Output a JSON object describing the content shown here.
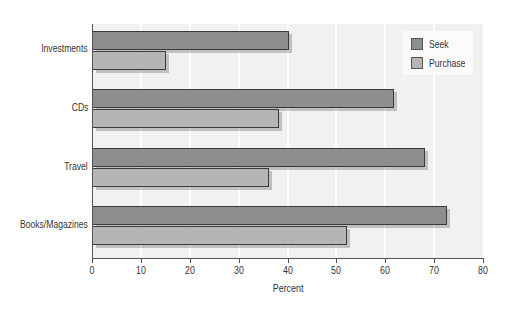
{
  "chart_data": {
    "type": "bar",
    "orientation": "horizontal",
    "title": "",
    "xlabel": "Percent",
    "ylabel": "",
    "xlim": [
      0,
      80
    ],
    "xticks": [
      0,
      10,
      20,
      30,
      40,
      50,
      60,
      70,
      80
    ],
    "grid": true,
    "legend_position": "top-right",
    "categories": [
      "Investments",
      "CDs",
      "Travel",
      "Books/Magazines"
    ],
    "series": [
      {
        "name": "Seek",
        "color": "#8e8e8e",
        "values": [
          40,
          61.5,
          68,
          72.5
        ]
      },
      {
        "name": "Purchase",
        "color": "#b5b5b5",
        "values": [
          15,
          38,
          36,
          52
        ]
      }
    ]
  },
  "labels": {
    "xlabel": "Percent",
    "ticks": [
      "0",
      "10",
      "20",
      "30",
      "40",
      "50",
      "60",
      "70",
      "80"
    ],
    "categories": [
      "Investments",
      "CDs",
      "Travel",
      "Books/Magazines"
    ],
    "legend": [
      "Seek",
      "Purchase"
    ]
  }
}
